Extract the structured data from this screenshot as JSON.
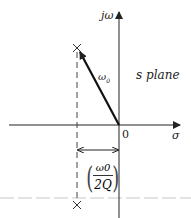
{
  "diagram": {
    "title": "s plane",
    "axes": {
      "vertical_label": "jω",
      "horizontal_label": "σ",
      "origin_label": "0"
    },
    "vector_label": "ω",
    "vector_label_subscript": "0",
    "dimension_label": {
      "numerator": "ω0",
      "denominator": "2Q"
    },
    "poles": [
      {
        "marker": "×",
        "position": "upper-left"
      },
      {
        "marker": "×",
        "position": "lower-left"
      }
    ],
    "colors": {
      "ink": "#222222",
      "dashed_guide": "#555555",
      "grey_line": "#bbbbbb"
    }
  }
}
